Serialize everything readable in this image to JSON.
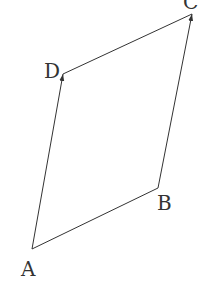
{
  "diagram": {
    "type": "vector-parallelogram",
    "stroke_color": "#333333",
    "background": "#ffffff",
    "vertices": {
      "A": {
        "label": "A",
        "x": 32,
        "y": 249,
        "label_x": 21,
        "label_y": 276
      },
      "B": {
        "label": "B",
        "x": 158,
        "y": 188,
        "label_x": 157,
        "label_y": 210
      },
      "C": {
        "label": "C",
        "x": 192,
        "y": 14,
        "label_x": 183,
        "label_y": 9
      },
      "D": {
        "label": "D",
        "x": 63,
        "y": 74,
        "label_x": 44,
        "label_y": 78
      }
    },
    "edges": [
      {
        "from": "A",
        "to": "D",
        "arrow": true
      },
      {
        "from": "B",
        "to": "C",
        "arrow": true
      },
      {
        "from": "D",
        "to": "C",
        "arrow": false
      },
      {
        "from": "A",
        "to": "B",
        "arrow": false
      }
    ]
  }
}
